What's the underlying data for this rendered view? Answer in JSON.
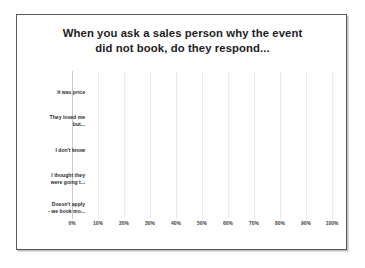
{
  "slide": {
    "title_line_1": "When you ask a sales person why the event",
    "title_line_2": "did not book, do they respond..."
  },
  "chart_data": {
    "type": "bar",
    "orientation": "horizontal",
    "title": "When you ask a sales person why the event did not book, do they respond...",
    "categories": [
      "It was price",
      "They loved me but...",
      "I don't know",
      "I thought they were going t...",
      "Doesn't apply - we book mo..."
    ],
    "category_lines": [
      [
        "It was price"
      ],
      [
        "They loved me",
        "but..."
      ],
      [
        "I don't know"
      ],
      [
        "I thought they",
        "were going t..."
      ],
      [
        "Doesn't apply",
        "- we book mo..."
      ]
    ],
    "values": [
      68,
      20,
      20,
      31,
      5
    ],
    "value_labels": [
      "68%",
      "20%",
      "20%",
      "31%",
      "5%"
    ],
    "bar_colors": [
      "#b9b9b9",
      "#a5a5a5",
      "#a0a0a0",
      "#969696",
      "#4c4c4c"
    ],
    "xlabel": "",
    "ylabel": "",
    "xlim": [
      0,
      100
    ],
    "xtick_labels": [
      "0%",
      "10%",
      "20%",
      "30%",
      "40%",
      "50%",
      "60%",
      "70%",
      "80%",
      "90%",
      "100%"
    ],
    "xtick_values": [
      0,
      10,
      20,
      30,
      40,
      50,
      60,
      70,
      80,
      90,
      100
    ],
    "grid": false,
    "legend": "none"
  }
}
